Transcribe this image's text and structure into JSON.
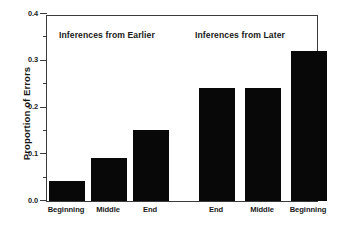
{
  "chart_data": {
    "type": "bar",
    "title": "",
    "xlabel": "",
    "ylabel": "Proportion of Errors",
    "ylim": [
      0.0,
      0.4
    ],
    "ytick_labels": [
      "0.0",
      "0.1",
      "0.2",
      "0.3",
      "0.4"
    ],
    "ytick_values": [
      0.0,
      0.1,
      0.2,
      0.3,
      0.4
    ],
    "minor_ticks": [
      0.05,
      0.15,
      0.25,
      0.35
    ],
    "grid": false,
    "legend": "none",
    "bar_color": "#080808",
    "axis_color": "#3b3b3b",
    "background": "#ffffff",
    "panels": [
      {
        "annotation": "Inferences from Earlier",
        "categories": [
          "Beginning",
          "Middle",
          "End"
        ],
        "values": [
          0.042,
          0.093,
          0.151
        ]
      },
      {
        "annotation": "Inferences from Later",
        "categories": [
          "End",
          "Middle",
          "Beginning"
        ],
        "values": [
          0.241,
          0.242,
          0.321
        ]
      }
    ],
    "categories": [
      "Beginning",
      "Middle",
      "End",
      "End",
      "Middle",
      "Beginning"
    ],
    "values": [
      0.042,
      0.093,
      0.151,
      0.241,
      0.242,
      0.321
    ],
    "annotations": [
      "Inferences from Earlier",
      "Inferences from Later"
    ]
  }
}
